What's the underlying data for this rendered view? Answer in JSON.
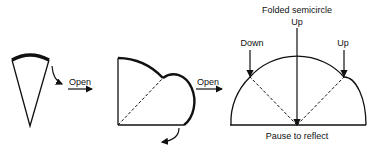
{
  "diagram": {
    "steps": [
      {
        "name": "cone",
        "arrow_label": "Open"
      },
      {
        "name": "quarter-circle",
        "arrow_label": "Open"
      },
      {
        "name": "folded-semicircle"
      }
    ],
    "labels": {
      "open_1": "Open",
      "open_2": "Open",
      "title": "Folded semicircle",
      "fold_left": "Down",
      "fold_center": "Up",
      "fold_right": "Up",
      "caption": "Pause to reflect"
    },
    "colors": {
      "stroke": "#111111",
      "background": "#ffffff"
    }
  }
}
